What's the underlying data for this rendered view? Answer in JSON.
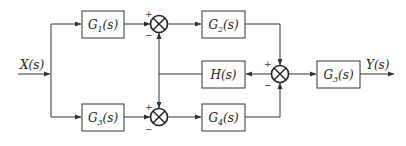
{
  "diagram": {
    "type": "block-diagram",
    "input": {
      "label": "X(s)"
    },
    "output": {
      "label": "Y(s)"
    },
    "blocks": [
      {
        "id": "G1",
        "base": "G",
        "sub": "1",
        "arg": "(s)"
      },
      {
        "id": "G2",
        "base": "G",
        "sub": "2",
        "arg": "(s)"
      },
      {
        "id": "H",
        "base": "H",
        "sub": "",
        "arg": "(s)"
      },
      {
        "id": "G3_out",
        "base": "G",
        "sub": "3",
        "arg": "(s)"
      },
      {
        "id": "G3_low",
        "base": "G",
        "sub": "3",
        "arg": "(s)"
      },
      {
        "id": "G4",
        "base": "G",
        "sub": "4",
        "arg": "(s)"
      }
    ],
    "junctions": [
      {
        "id": "S1",
        "plus": "+",
        "minus": "−"
      },
      {
        "id": "S2",
        "plus": "+",
        "minus": "−"
      },
      {
        "id": "S3",
        "plus": "+",
        "minus": "−"
      }
    ]
  }
}
